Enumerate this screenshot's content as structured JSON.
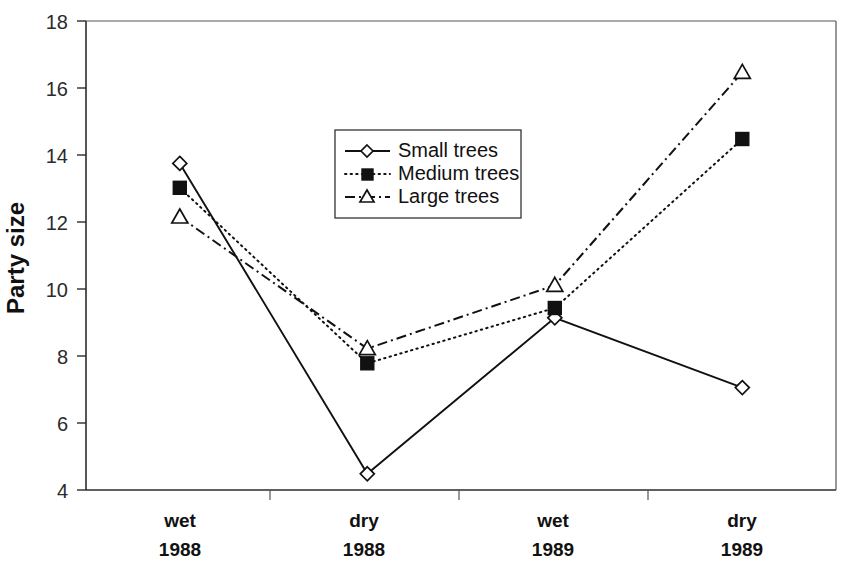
{
  "chart_data": {
    "type": "line",
    "title": "",
    "xlabel": "",
    "ylabel": "Party size",
    "ylim": [
      4,
      18
    ],
    "yticks": [
      4,
      6,
      8,
      10,
      12,
      14,
      16,
      18
    ],
    "ytick_labels": [
      "4",
      "6",
      "8",
      "10",
      "12",
      "14",
      "16",
      "18"
    ],
    "grid": false,
    "legend_position": "upper center",
    "categories": [
      "wet\n1988",
      "dry\n1988",
      "wet\n1989",
      "dry\n1989"
    ],
    "category_lines": [
      [
        "wet",
        "1988"
      ],
      [
        "dry",
        "1988"
      ],
      [
        "wet",
        "1989"
      ],
      [
        "dry",
        "1989"
      ]
    ],
    "series": [
      {
        "name": "Small trees",
        "marker": "open-diamond",
        "linestyle": "solid",
        "values": [
          14.05,
          4.5,
          9.3,
          7.15
        ]
      },
      {
        "name": "Medium trees",
        "marker": "filled-square",
        "linestyle": "dotted",
        "values": [
          13.3,
          7.9,
          9.6,
          14.8
        ]
      },
      {
        "name": "Large trees",
        "marker": "open-triangle",
        "linestyle": "dash-dot",
        "values": [
          12.4,
          8.35,
          10.3,
          16.85
        ]
      }
    ]
  },
  "legend": {
    "entries": [
      {
        "label": "Small trees"
      },
      {
        "label": "Medium trees"
      },
      {
        "label": "Large trees"
      }
    ]
  },
  "colors": {
    "ink": "#111111",
    "axis": "#2b2b2b",
    "frame": "#555555",
    "background": "#ffffff"
  }
}
